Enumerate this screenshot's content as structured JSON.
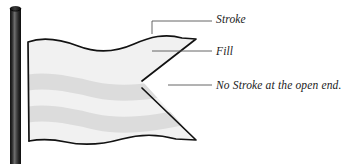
{
  "figure": {
    "background_color": "#ffffff"
  },
  "pole": {
    "name": "flagpole",
    "color_dark": "#1a1a1a",
    "color_mid": "#4d4d4d",
    "color_highlight": "#7a7a7a",
    "cap_color": "#111111"
  },
  "flag": {
    "name": "swallowtail-flag",
    "fill_color": "#f1f1f1",
    "band_color": "#dcdcdc",
    "stroke_color": "#121212",
    "stroke_width": 1.6,
    "band_count": 2
  },
  "annotations": [
    {
      "id": "stroke",
      "label": "Stroke",
      "leader": "elbow",
      "line_color": "#555555"
    },
    {
      "id": "fill",
      "label": "Fill",
      "leader": "horizontal",
      "line_color": "#555555"
    },
    {
      "id": "open-end",
      "label": "No Stroke at the open end.",
      "leader": "horizontal",
      "line_color": "#555555"
    }
  ]
}
